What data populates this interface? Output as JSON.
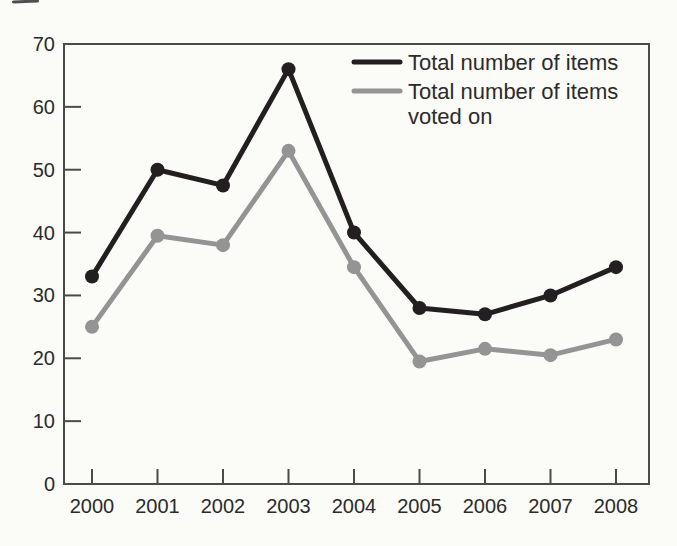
{
  "figure": {
    "kind": "scanned-book-line-chart",
    "background_color": "#fbfbf8"
  },
  "chart_data": {
    "type": "line",
    "title": "",
    "xlabel": "",
    "ylabel": "",
    "categories": [
      "2000",
      "2001",
      "2002",
      "2003",
      "2004",
      "2005",
      "2006",
      "2007",
      "2008"
    ],
    "series": [
      {
        "name": "Total number of items",
        "color": "#231f20",
        "marker": "circle",
        "values": [
          33,
          50,
          47.5,
          66,
          40,
          28,
          27,
          30,
          34.5
        ]
      },
      {
        "name": "Total number of items voted on",
        "color": "#949494",
        "marker": "circle",
        "values": [
          25,
          39.5,
          38,
          53,
          34.5,
          19.5,
          21.5,
          20.5,
          23
        ]
      }
    ],
    "ylim": [
      0,
      70
    ],
    "yticks": [
      0,
      10,
      20,
      30,
      40,
      50,
      60,
      70
    ],
    "grid": false,
    "frame": "full-box",
    "tick_direction": "inside",
    "legend_position": "top-right-inside",
    "legend": [
      {
        "lines": [
          "Total number of items"
        ],
        "color": "#231f20"
      },
      {
        "lines": [
          "Total number of items",
          "voted on"
        ],
        "color": "#949494"
      }
    ],
    "colors": {
      "axis": "#4a4a4a",
      "text": "#2b2b2b",
      "background": "#fbfbf8"
    }
  }
}
